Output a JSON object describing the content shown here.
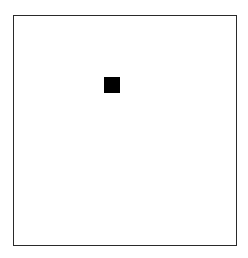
{
  "canvas": {
    "background": "#ffffff",
    "border_color": "#2a2a2a"
  },
  "marker": {
    "shape": "square",
    "color": "#000000",
    "x": 104,
    "y": 77,
    "size": 16
  }
}
